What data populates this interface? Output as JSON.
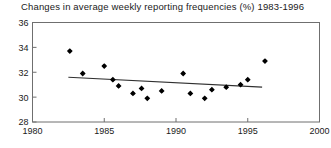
{
  "chart_data": {
    "type": "scatter",
    "title": "Changes in average weekly reporting frequencies (%) 1983-1996",
    "xlabel": "",
    "ylabel": "",
    "xlim": [
      1980,
      2000
    ],
    "ylim": [
      28,
      36
    ],
    "xticks": [
      1980,
      1985,
      1990,
      1995,
      2000
    ],
    "xtick_labels": [
      "1980",
      "1985",
      "1990",
      "1995",
      "2000"
    ],
    "yticks": [
      28,
      30,
      32,
      34,
      36
    ],
    "ytick_labels": [
      "28",
      "30",
      "32",
      "34",
      "36"
    ],
    "grid": false,
    "legend": null,
    "marker": "filled-diamond",
    "marker_color": "#000000",
    "series": [
      {
        "name": "average weekly reporting frequency",
        "x": [
          1982.6,
          1983.5,
          1985.0,
          1985.6,
          1986.0,
          1987.0,
          1987.6,
          1988.0,
          1989.0,
          1990.5,
          1991.0,
          1992.0,
          1992.5,
          1993.5,
          1994.5,
          1995.0,
          1996.2
        ],
        "y": [
          33.7,
          31.9,
          32.5,
          31.4,
          30.9,
          30.3,
          30.7,
          29.9,
          30.5,
          31.9,
          30.3,
          29.9,
          30.6,
          30.8,
          31.0,
          31.4,
          32.9
        ]
      }
    ],
    "trendline": {
      "type": "linear-fit",
      "color": "#303030",
      "x": [
        1982.5,
        1996.0
      ],
      "y": [
        31.6,
        30.8
      ]
    }
  }
}
